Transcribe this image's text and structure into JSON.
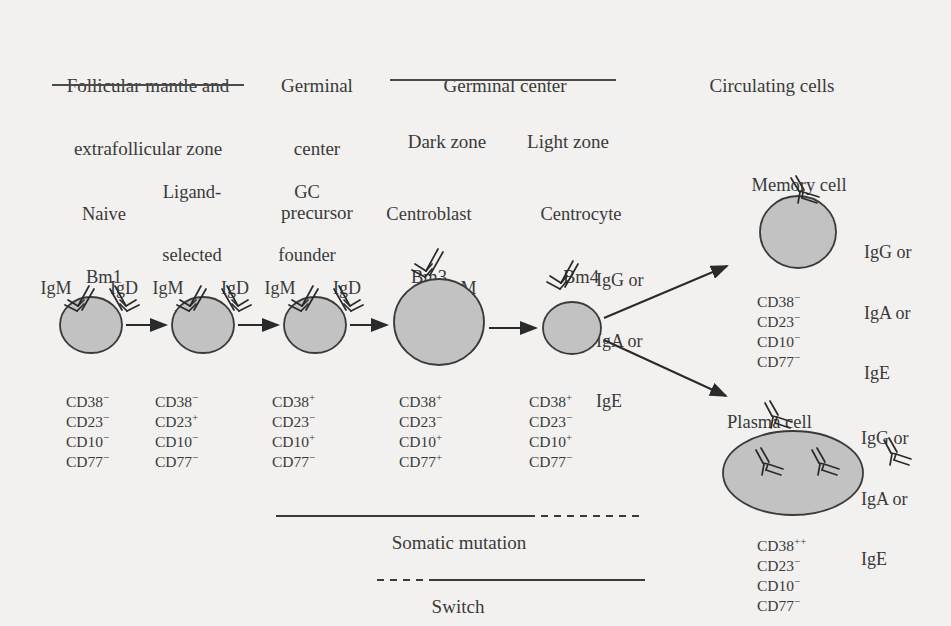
{
  "figure": {
    "background_color": "#f2f1ef",
    "cell_fill": "#c2c2c2",
    "stroke_color": "#3a3a3a"
  },
  "headers": [
    {
      "id": "follicular",
      "lines": [
        "Follicular mantle and",
        "extrafollicular zone"
      ]
    },
    {
      "id": "gc-precursor",
      "lines": [
        "Germinal",
        "center",
        "precursor"
      ]
    },
    {
      "id": "germinal-center",
      "lines": [
        "Germinal center"
      ]
    },
    {
      "id": "circulating",
      "lines": [
        "Circulating cells"
      ]
    }
  ],
  "subzones": [
    {
      "id": "dark-zone",
      "label": "Dark zone"
    },
    {
      "id": "light-zone",
      "label": "Light zone"
    }
  ],
  "stages": [
    {
      "id": "naive",
      "name_lines": [
        "Naive",
        "Bm1"
      ],
      "surface_ig": [
        "IgM",
        "IgD"
      ],
      "markers": [
        "CD38",
        "CD23",
        "CD10",
        "CD77"
      ],
      "marker_signs": [
        "−",
        "−",
        "−",
        "−"
      ]
    },
    {
      "id": "ligand-selected",
      "name_lines": [
        "Ligand-",
        "selected",
        "Bm2"
      ],
      "surface_ig": [
        "IgM",
        "IgD"
      ],
      "markers": [
        "CD38",
        "CD23",
        "CD10",
        "CD77"
      ],
      "marker_signs": [
        "−",
        "+",
        "−",
        "−"
      ]
    },
    {
      "id": "gc-founder",
      "name_lines": [
        "GC",
        "founder",
        "Bm2"
      ],
      "surface_ig": [
        "IgM",
        "IgD"
      ],
      "markers": [
        "CD38",
        "CD23",
        "CD10",
        "CD77"
      ],
      "marker_signs": [
        "+",
        "−",
        "+",
        "−"
      ]
    },
    {
      "id": "centroblast",
      "name_lines": [
        "Centroblast",
        "Bm3"
      ],
      "surface_ig": [
        "IgM"
      ],
      "markers": [
        "CD38",
        "CD23",
        "CD10",
        "CD77"
      ],
      "marker_signs": [
        "+",
        "−",
        "+",
        "+"
      ]
    },
    {
      "id": "centrocyte",
      "name_lines": [
        "Centrocyte",
        "Bm4"
      ],
      "surface_ig": [
        "IgG or",
        "IgA or",
        "IgE"
      ],
      "markers": [
        "CD38",
        "CD23",
        "CD10",
        "CD77"
      ],
      "marker_signs": [
        "+",
        "−",
        "+",
        "−"
      ]
    }
  ],
  "outcomes": [
    {
      "id": "memory-cell",
      "name_lines": [
        "Memory cell",
        "Bm5"
      ],
      "isotypes": [
        "IgG or",
        "IgA or",
        "IgE"
      ],
      "markers": [
        "CD38",
        "CD23",
        "CD10",
        "CD77"
      ],
      "marker_signs": [
        "−",
        "−",
        "−",
        "−"
      ]
    },
    {
      "id": "plasma-cell",
      "name_lines": [
        "Plasma cell"
      ],
      "isotypes": [
        "IgG or",
        "IgA or",
        "IgE"
      ],
      "markers": [
        "CD38",
        "CD23",
        "CD10",
        "CD77"
      ],
      "marker_signs": [
        "++",
        "−",
        "−",
        "−"
      ]
    }
  ],
  "annotations": [
    {
      "id": "somatic-mutation",
      "label": "Somatic mutation"
    },
    {
      "id": "switch",
      "label": "Switch"
    }
  ]
}
